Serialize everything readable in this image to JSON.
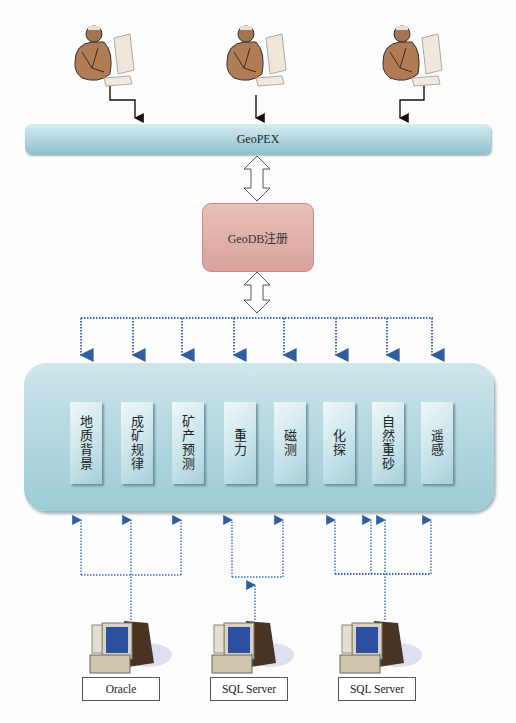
{
  "users": [
    {
      "label": "user-1"
    },
    {
      "label": "user-2"
    },
    {
      "label": "user-3"
    }
  ],
  "geopex": {
    "label": "GeoPEX"
  },
  "geodb": {
    "label": "GeoDB注册"
  },
  "modules": [
    {
      "label": "地质背景"
    },
    {
      "label": "成矿规律"
    },
    {
      "label": "矿产预测"
    },
    {
      "label": "重力"
    },
    {
      "label": "磁测"
    },
    {
      "label": "化探"
    },
    {
      "label": "自然重砂"
    },
    {
      "label": "遥感"
    }
  ],
  "databases": [
    {
      "label": "Oracle"
    },
    {
      "label": "SQL Server"
    },
    {
      "label": "SQL Server"
    }
  ],
  "colors": {
    "bar": "#b6d9e2",
    "geodb": "#dfaea7",
    "panel": "#b8dae3",
    "dotted_line": "#3d6fb0",
    "arrow_black": "#111111"
  }
}
